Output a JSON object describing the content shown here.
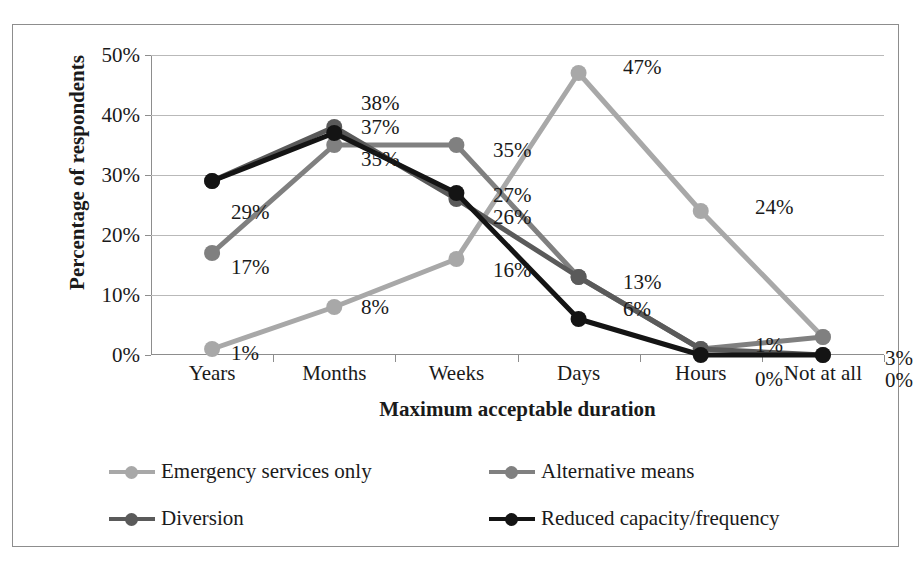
{
  "chart_data": {
    "type": "line",
    "title": "",
    "xlabel": "Maximum acceptable duration",
    "ylabel": "Percentage of respondents",
    "categories": [
      "Years",
      "Months",
      "Weeks",
      "Days",
      "Hours",
      "Not at all"
    ],
    "ylim": [
      0,
      50
    ],
    "ytick_labels": [
      "0%",
      "10%",
      "20%",
      "30%",
      "40%",
      "50%"
    ],
    "ytick_values": [
      0,
      10,
      20,
      30,
      40,
      50
    ],
    "grid": true,
    "legend_position": "bottom",
    "series": [
      {
        "name": "Emergency services only",
        "color": "#a8a8a8",
        "values": [
          1,
          8,
          16,
          47,
          24,
          3
        ],
        "labels": [
          "1%",
          "8%",
          "16%",
          "47%",
          "24%",
          "3%"
        ]
      },
      {
        "name": "Alternative means",
        "color": "#808080",
        "values": [
          17,
          35,
          35,
          13,
          1,
          3
        ],
        "labels": [
          "17%",
          "35%",
          "35%",
          "13%",
          "1%",
          "3%"
        ]
      },
      {
        "name": "Diversion",
        "color": "#5a5a5a",
        "values": [
          29,
          38,
          26,
          13,
          1,
          0
        ],
        "labels": [
          "29%",
          "38%",
          "26%",
          "13%",
          "1%",
          "0%"
        ]
      },
      {
        "name": "Reduced capacity/frequency",
        "color": "#141414",
        "values": [
          29,
          37,
          27,
          6,
          0,
          0
        ],
        "labels": [
          "29%",
          "37%",
          "27%",
          "6%",
          "0%",
          "0%"
        ]
      }
    ],
    "point_labels": [
      {
        "text": "29%",
        "x": 218,
        "y": 177
      },
      {
        "text": "17%",
        "x": 218,
        "y": 232
      },
      {
        "text": "1%",
        "x": 218,
        "y": 318
      },
      {
        "text": "38%",
        "x": 348,
        "y": 68
      },
      {
        "text": "37%",
        "x": 348,
        "y": 92
      },
      {
        "text": "35%",
        "x": 348,
        "y": 124
      },
      {
        "text": "8%",
        "x": 348,
        "y": 272
      },
      {
        "text": "35%",
        "x": 480,
        "y": 115
      },
      {
        "text": "27%",
        "x": 480,
        "y": 160
      },
      {
        "text": "26%",
        "x": 480,
        "y": 182
      },
      {
        "text": "16%",
        "x": 480,
        "y": 235
      },
      {
        "text": "47%",
        "x": 610,
        "y": 32
      },
      {
        "text": "13%",
        "x": 610,
        "y": 247
      },
      {
        "text": "6%",
        "x": 610,
        "y": 274
      },
      {
        "text": "24%",
        "x": 742,
        "y": 172
      },
      {
        "text": "1%",
        "x": 742,
        "y": 310
      },
      {
        "text": "0%",
        "x": 742,
        "y": 344
      },
      {
        "text": "3%",
        "x": 872,
        "y": 323
      },
      {
        "text": "0%",
        "x": 872,
        "y": 345
      }
    ]
  }
}
